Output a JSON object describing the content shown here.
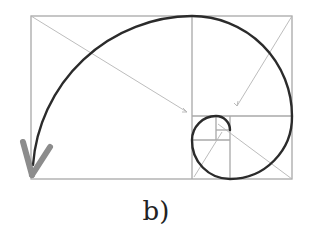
{
  "figure": {
    "caption": "b)",
    "colors": {
      "grid": "#a8a8a8",
      "diagonal": "#b0b0b0",
      "spiral": "#2b2b2b",
      "arrowhead": "#8c8c8c"
    }
  }
}
